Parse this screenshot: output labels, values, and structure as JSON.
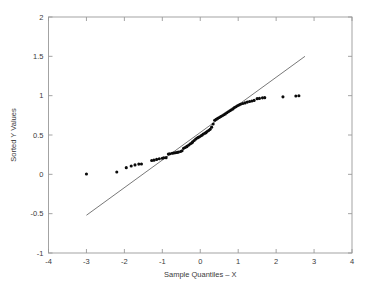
{
  "chart_data": {
    "type": "scatter",
    "title": "",
    "subtitle": "",
    "xlabel": "Sample Quantiles – X",
    "ylabel": "Sorted Y Values",
    "xlim": [
      -4,
      4
    ],
    "ylim": [
      -1,
      2
    ],
    "xticks": [
      -4,
      -3,
      -2,
      -1,
      0,
      1,
      2,
      3,
      4
    ],
    "xtick_labels": [
      "-4",
      "-3",
      "-2",
      "-1",
      "0",
      "1",
      "2",
      "3",
      "4"
    ],
    "yticks": [
      -1,
      -0.5,
      0,
      0.5,
      1,
      1.5,
      2
    ],
    "ytick_labels": [
      "-1",
      "-0.5",
      "0",
      "0.5",
      "1",
      "1.5",
      "2"
    ],
    "grid": false,
    "legend": null,
    "marker": "filled-circle",
    "marker_color": "#0b0b0b",
    "reference_line": {
      "style": "solid",
      "color": "#555555",
      "x": [
        -3.0,
        2.76
      ],
      "y": [
        -0.52,
        1.5
      ]
    },
    "points": [
      {
        "x": -3.0,
        "y": 0.005
      },
      {
        "x": -2.2,
        "y": 0.03
      },
      {
        "x": -1.95,
        "y": 0.085
      },
      {
        "x": -1.82,
        "y": 0.105
      },
      {
        "x": -1.72,
        "y": 0.12
      },
      {
        "x": -1.62,
        "y": 0.13
      },
      {
        "x": -1.55,
        "y": 0.132
      },
      {
        "x": -1.28,
        "y": 0.175
      },
      {
        "x": -1.22,
        "y": 0.18
      },
      {
        "x": -1.15,
        "y": 0.19
      },
      {
        "x": -1.08,
        "y": 0.198
      },
      {
        "x": -1.0,
        "y": 0.205
      },
      {
        "x": -0.96,
        "y": 0.21
      },
      {
        "x": -0.9,
        "y": 0.212
      },
      {
        "x": -0.84,
        "y": 0.258
      },
      {
        "x": -0.8,
        "y": 0.262
      },
      {
        "x": -0.74,
        "y": 0.268
      },
      {
        "x": -0.7,
        "y": 0.272
      },
      {
        "x": -0.66,
        "y": 0.275
      },
      {
        "x": -0.62,
        "y": 0.278
      },
      {
        "x": -0.58,
        "y": 0.282
      },
      {
        "x": -0.52,
        "y": 0.29
      },
      {
        "x": -0.48,
        "y": 0.3
      },
      {
        "x": -0.44,
        "y": 0.33
      },
      {
        "x": -0.4,
        "y": 0.342
      },
      {
        "x": -0.36,
        "y": 0.352
      },
      {
        "x": -0.34,
        "y": 0.36
      },
      {
        "x": -0.3,
        "y": 0.372
      },
      {
        "x": -0.26,
        "y": 0.388
      },
      {
        "x": -0.22,
        "y": 0.4
      },
      {
        "x": -0.2,
        "y": 0.412
      },
      {
        "x": -0.16,
        "y": 0.43
      },
      {
        "x": -0.12,
        "y": 0.448
      },
      {
        "x": -0.08,
        "y": 0.462
      },
      {
        "x": -0.05,
        "y": 0.47
      },
      {
        "x": -0.02,
        "y": 0.478
      },
      {
        "x": 0.02,
        "y": 0.49
      },
      {
        "x": 0.05,
        "y": 0.5
      },
      {
        "x": 0.08,
        "y": 0.512
      },
      {
        "x": 0.12,
        "y": 0.522
      },
      {
        "x": 0.15,
        "y": 0.53
      },
      {
        "x": 0.18,
        "y": 0.545
      },
      {
        "x": 0.22,
        "y": 0.558
      },
      {
        "x": 0.26,
        "y": 0.572
      },
      {
        "x": 0.3,
        "y": 0.6
      },
      {
        "x": 0.34,
        "y": 0.64
      },
      {
        "x": 0.38,
        "y": 0.688
      },
      {
        "x": 0.42,
        "y": 0.7
      },
      {
        "x": 0.46,
        "y": 0.712
      },
      {
        "x": 0.5,
        "y": 0.722
      },
      {
        "x": 0.54,
        "y": 0.735
      },
      {
        "x": 0.58,
        "y": 0.745
      },
      {
        "x": 0.62,
        "y": 0.758
      },
      {
        "x": 0.66,
        "y": 0.768
      },
      {
        "x": 0.7,
        "y": 0.782
      },
      {
        "x": 0.74,
        "y": 0.795
      },
      {
        "x": 0.78,
        "y": 0.808
      },
      {
        "x": 0.82,
        "y": 0.82
      },
      {
        "x": 0.86,
        "y": 0.832
      },
      {
        "x": 0.9,
        "y": 0.848
      },
      {
        "x": 0.94,
        "y": 0.86
      },
      {
        "x": 0.98,
        "y": 0.872
      },
      {
        "x": 1.02,
        "y": 0.882
      },
      {
        "x": 1.06,
        "y": 0.89
      },
      {
        "x": 1.12,
        "y": 0.9
      },
      {
        "x": 1.18,
        "y": 0.908
      },
      {
        "x": 1.24,
        "y": 0.918
      },
      {
        "x": 1.3,
        "y": 0.925
      },
      {
        "x": 1.36,
        "y": 0.932
      },
      {
        "x": 1.42,
        "y": 0.94
      },
      {
        "x": 1.5,
        "y": 0.962
      },
      {
        "x": 1.56,
        "y": 0.965
      },
      {
        "x": 1.64,
        "y": 0.972
      },
      {
        "x": 1.7,
        "y": 0.975
      },
      {
        "x": 2.18,
        "y": 0.985
      },
      {
        "x": 2.52,
        "y": 0.995
      },
      {
        "x": 2.6,
        "y": 0.998
      }
    ]
  }
}
